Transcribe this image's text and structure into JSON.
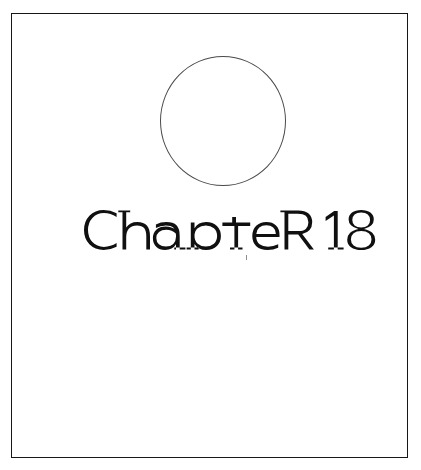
{
  "page": {
    "kind": "book-chapter-opening-page",
    "background_color": "#ffffff",
    "width": 421,
    "height": 470
  },
  "frame": {
    "name": "page-border-rule",
    "color": "#171717",
    "stroke_width": 1.6,
    "x": 11,
    "y": 13,
    "width": 397,
    "height": 445
  },
  "ornament": {
    "shape": "circle",
    "label": "decorative circle",
    "color": "#4a4a4e",
    "stroke_width": 1.15,
    "center_x": 211,
    "center_y": 107,
    "diameter": 128,
    "filled": false
  },
  "heading": {
    "text": "CHAPTER 18",
    "word": "CHAPTER",
    "number": "18",
    "color": "#101010",
    "style": "unicase art-deco display lettering",
    "x": 74,
    "y": 196,
    "width": 274,
    "cap_height": 33
  },
  "artifact": {
    "label": "scan speck",
    "color": "#8c8c93",
    "x": 234,
    "y": 241
  }
}
